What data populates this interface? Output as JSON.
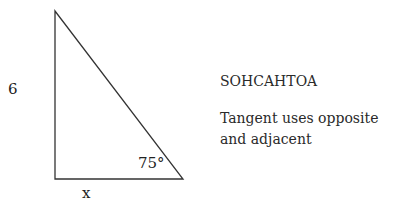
{
  "diagram": {
    "type": "right-triangle",
    "vertices": {
      "top": [
        55,
        11
      ],
      "right_angle": [
        55,
        179
      ],
      "bottom_right": [
        183,
        179
      ]
    },
    "labels": {
      "vertical_side": "6",
      "horizontal_side": "x",
      "angle": "75°"
    },
    "line_color": "#333333"
  },
  "notes": {
    "mnemonic": "SOHCAHTOA",
    "hint": "Tangent uses opposite and adjacent"
  }
}
